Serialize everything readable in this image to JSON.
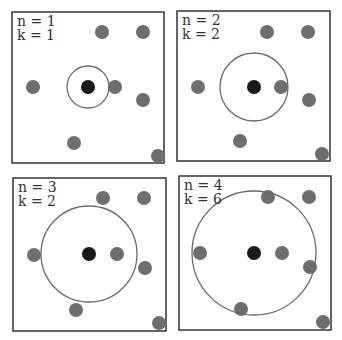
{
  "colors": {
    "query_point": "#1a1a1a",
    "neighbor_point": "#6e6e6e",
    "circle_stroke": "#6a6a6a",
    "box_stroke": "#333333"
  },
  "panels": [
    {
      "n_label": "n = 1",
      "k_label": "k = 1",
      "n": 1,
      "k": 1,
      "box": {
        "x": 12,
        "y": 12,
        "w": 152,
        "h": 151
      },
      "query": {
        "x": 88,
        "y": 87
      },
      "circle_radius": 21,
      "points": [
        [
          102,
          32
        ],
        [
          143,
          32
        ],
        [
          33,
          87
        ],
        [
          115,
          87
        ],
        [
          143,
          100
        ],
        [
          74,
          143
        ],
        [
          158,
          156
        ]
      ]
    },
    {
      "n_label": "n = 2",
      "k_label": "k = 2",
      "n": 2,
      "k": 2,
      "box": {
        "x": 177,
        "y": 11,
        "w": 153,
        "h": 150
      },
      "query": {
        "x": 254,
        "y": 87
      },
      "circle_radius": 34,
      "points": [
        [
          267,
          32
        ],
        [
          308,
          32
        ],
        [
          198,
          87
        ],
        [
          281,
          87
        ],
        [
          309,
          100
        ],
        [
          240,
          141
        ],
        [
          322,
          154
        ]
      ]
    },
    {
      "n_label": "n = 3",
      "k_label": "k = 2",
      "n": 3,
      "k": 2,
      "box": {
        "x": 13,
        "y": 178,
        "w": 153,
        "h": 153
      },
      "query": {
        "x": 89,
        "y": 254
      },
      "circle_radius": 48,
      "points": [
        [
          103,
          198
        ],
        [
          144,
          198
        ],
        [
          34,
          255
        ],
        [
          117,
          254
        ],
        [
          145,
          268
        ],
        [
          76,
          310
        ],
        [
          159,
          323
        ]
      ]
    },
    {
      "n_label": "n = 4",
      "k_label": "k = 6",
      "n": 4,
      "k": 6,
      "box": {
        "x": 179,
        "y": 176,
        "w": 152,
        "h": 154
      },
      "query": {
        "x": 254,
        "y": 253
      },
      "circle_radius": 62,
      "points": [
        [
          268,
          197
        ],
        [
          309,
          197
        ],
        [
          200,
          253
        ],
        [
          282,
          253
        ],
        [
          310,
          267
        ],
        [
          241,
          309
        ],
        [
          323,
          322
        ]
      ]
    }
  ]
}
